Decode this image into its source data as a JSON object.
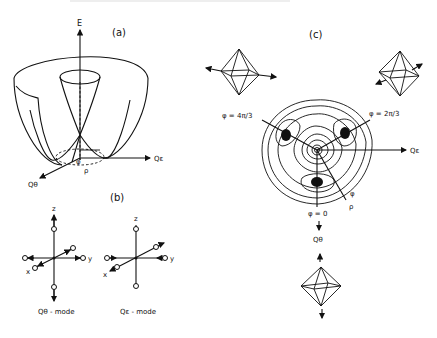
{
  "figure": {
    "panels": {
      "a": {
        "label": "(a)",
        "axis_vertical": "E",
        "axis_right": "Qε",
        "axis_front": "Qθ",
        "angle_label": "φ",
        "radius_label": "ρ"
      },
      "b": {
        "label": "(b)",
        "modes": [
          {
            "caption": "Qθ - mode",
            "axis_z": "z",
            "axis_x": "x",
            "axis_y": "y"
          },
          {
            "caption": "Qε - mode",
            "axis_z": "z",
            "axis_x": "x",
            "axis_y": "y"
          }
        ]
      },
      "c": {
        "label": "(c)",
        "axis_right": "Qε",
        "axis_down": "Qθ",
        "minima_labels": [
          "φ = 4π/3",
          "φ = 2π/3",
          "φ = 0"
        ],
        "angle_label": "φ",
        "radius_label": "ρ"
      }
    }
  }
}
